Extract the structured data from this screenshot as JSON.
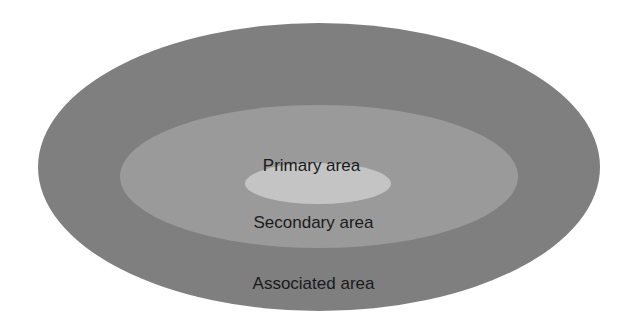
{
  "diagram": {
    "type": "nested-ellipses",
    "layers": [
      {
        "id": "associated",
        "label": "Associated area",
        "color": "#7f7f7f"
      },
      {
        "id": "secondary",
        "label": "Secondary area",
        "color": "#9a9a9a"
      },
      {
        "id": "primary",
        "label": "Primary area",
        "color": "#c4c4c4"
      }
    ]
  }
}
